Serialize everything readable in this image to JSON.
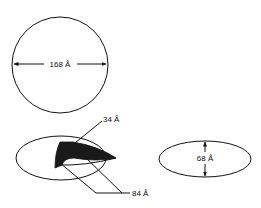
{
  "diagram": {
    "shapes": [
      {
        "id": "sphere",
        "kind": "circle",
        "dimension_label": "168 Å"
      },
      {
        "id": "oblate-with-wedge",
        "kind": "ellipse",
        "wedge_label_thickness": "34 Å",
        "wedge_label_length": "84 Å"
      },
      {
        "id": "oblate-ellipsoid",
        "kind": "ellipse",
        "dimension_label": "68 Å"
      }
    ],
    "labels": {
      "circle_diameter": "168 Å",
      "wedge_thickness": "34 Å",
      "wedge_length": "84 Å",
      "ellipse_minor_axis": "68 Å"
    },
    "colors": {
      "stroke": "#111111",
      "fill_dark": "#1a1a1a",
      "background": "#ffffff"
    }
  }
}
